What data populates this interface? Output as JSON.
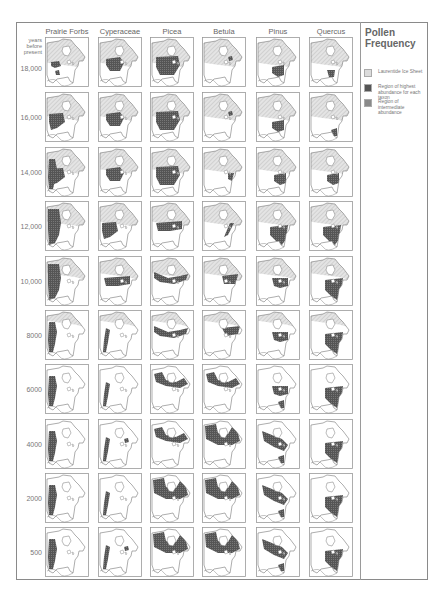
{
  "figure": {
    "title": "Pollen Frequency",
    "yaxis_title": "years before present",
    "columns": [
      "Prairie Forbs",
      "Cyperaceae",
      "Picea",
      "Betula",
      "Pinus",
      "Quercus"
    ],
    "rows": [
      "18,000",
      "16,000",
      "14,000",
      "12,000",
      "10,000",
      "8000",
      "6000",
      "4000",
      "2000",
      "500"
    ],
    "colors": {
      "ice": "#d9d9d9",
      "high": "#5a5a5a",
      "intermediate": "#8c8c8c",
      "outline": "#6e6e6e",
      "frame": "#8a8a8a"
    }
  },
  "legend": {
    "title_line1": "Pollen",
    "title_line2": "Frequency",
    "items": [
      {
        "label": "Laurentide Ice Sheet",
        "swatch": "ice"
      },
      {
        "label": "Region of highest abundance for each taxon",
        "swatch": "high"
      },
      {
        "label": "Region of intermediate abundance",
        "swatch": "intermediate"
      }
    ]
  },
  "chart_data": {
    "type": "heatmap",
    "title": "Pollen Frequency",
    "xlabel": "Taxon",
    "ylabel": "years before present",
    "categories": [
      "Prairie Forbs",
      "Cyperaceae",
      "Picea",
      "Betula",
      "Pinus",
      "Quercus"
    ],
    "y": [
      "18,000",
      "16,000",
      "14,000",
      "12,000",
      "10,000",
      "8000",
      "6000",
      "4000",
      "2000",
      "500"
    ],
    "ice_extent": [
      0.55,
      0.52,
      0.48,
      0.45,
      0.38,
      0.25,
      0,
      0,
      0,
      0
    ],
    "panels": [
      [
        [
          "sw-small",
          "s-small"
        ],
        [
          "central"
        ],
        [
          "central-big"
        ],
        [
          "ne-dot"
        ],
        [
          "se"
        ],
        [
          "s-small-mid"
        ]
      ],
      [
        [
          "central-w"
        ],
        [
          "central"
        ],
        [
          "central-big"
        ],
        [
          "ne-dot"
        ],
        [
          "se"
        ],
        [
          "se-small"
        ]
      ],
      [
        [
          "west",
          "central-w"
        ],
        [
          "central"
        ],
        [
          "central-big"
        ],
        [
          "east-small"
        ],
        [
          "se-mid"
        ],
        [
          "se-mid"
        ]
      ],
      [
        [
          "west-big"
        ],
        [
          "central-w"
        ],
        [
          "central-band"
        ],
        [
          "east-strip"
        ],
        [
          "se-big"
        ],
        [
          "se-big"
        ]
      ],
      [
        [
          "west-big"
        ],
        [
          "central-band"
        ],
        [
          "boreal-band"
        ],
        [
          "east-band"
        ],
        [
          "east-mid"
        ],
        [
          "east-big"
        ]
      ],
      [
        [
          "west"
        ],
        [
          "west-strip"
        ],
        [
          "boreal-band"
        ],
        [
          "ne-band"
        ],
        [
          "east-mid"
        ],
        [
          "east-big"
        ]
      ],
      [
        [
          "west"
        ],
        [
          "west-strip"
        ],
        [
          "boreal-n"
        ],
        [
          "boreal-n"
        ],
        [
          "east-mid",
          "se-small"
        ],
        [
          "east-big"
        ]
      ],
      [
        [
          "west"
        ],
        [
          "west-strip",
          "ne-dot"
        ],
        [
          "boreal-n"
        ],
        [
          "boreal-full"
        ],
        [
          "boreal-s",
          "se-small"
        ],
        [
          "east-big"
        ]
      ],
      [
        [
          "west"
        ],
        [
          "west-strip"
        ],
        [
          "boreal-full"
        ],
        [
          "boreal-full"
        ],
        [
          "boreal-s",
          "se-small"
        ],
        [
          "east-big"
        ]
      ],
      [
        [
          "west"
        ],
        [
          "west-strip",
          "ne-dot"
        ],
        [
          "boreal-full"
        ],
        [
          "boreal-full"
        ],
        [
          "boreal-s",
          "se-small"
        ],
        [
          "east-big"
        ]
      ]
    ]
  }
}
